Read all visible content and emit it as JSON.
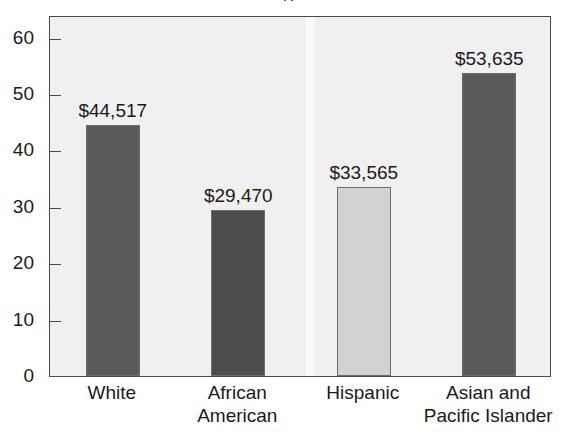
{
  "chart_data": {
    "type": "bar",
    "title": "",
    "title_clipped_remnant": "(   )",
    "xlabel": "",
    "ylabel": "",
    "categories": [
      "White",
      "African American",
      "Hispanic",
      "Asian and Pacific Islander"
    ],
    "category_lines": [
      [
        "White"
      ],
      [
        "African",
        "American"
      ],
      [
        "Hispanic"
      ],
      [
        "Asian and",
        "Pacific Islander"
      ]
    ],
    "values": [
      44.517,
      29.47,
      33.565,
      53.635
    ],
    "value_labels": [
      "$44,517",
      "$29,470",
      "$33,565",
      "$53,635"
    ],
    "value_units": "thousands of dollars",
    "bar_colors": [
      "#5a5a5a",
      "#4d4d4d",
      "#d2d2d2",
      "#5a5a5a"
    ],
    "ylim": [
      0,
      64
    ],
    "yticks": [
      0,
      10,
      20,
      30,
      40,
      50,
      60
    ],
    "ytick_labels": [
      "0",
      "10",
      "20",
      "30",
      "40",
      "50",
      "60"
    ],
    "grid": false,
    "legend": false,
    "plot_background": "#f0f0f0",
    "axis_color": "#4a4a4a"
  }
}
